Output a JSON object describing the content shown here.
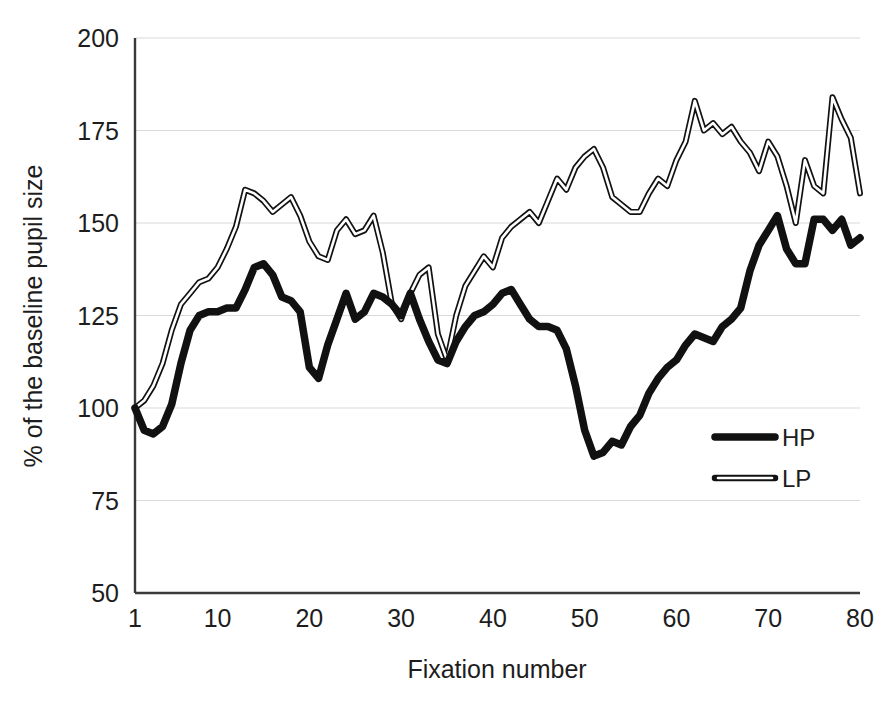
{
  "chart_data": {
    "type": "line",
    "title": "",
    "subtitle": "",
    "xlabel": "Fixation number",
    "ylabel": "% of the baseline pupil size",
    "xlim": [
      1,
      80
    ],
    "ylim": [
      50,
      200
    ],
    "xticks": [
      1,
      10,
      20,
      30,
      40,
      50,
      60,
      70,
      80
    ],
    "xtick_labels": [
      "1",
      "10",
      "20",
      "30",
      "40",
      "50",
      "60",
      "70",
      "80"
    ],
    "yticks": [
      50,
      75,
      100,
      125,
      150,
      175,
      200
    ],
    "ytick_labels": [
      "50",
      "75",
      "100",
      "125",
      "150",
      "175",
      "200"
    ],
    "grid": "horizontal-only",
    "grid_color": "#d9d9d9",
    "axis_color": "#3a3a3a",
    "legend_position": "inside-right-middle",
    "x": [
      1,
      2,
      3,
      4,
      5,
      6,
      7,
      8,
      9,
      10,
      11,
      12,
      13,
      14,
      15,
      16,
      17,
      18,
      19,
      20,
      21,
      22,
      23,
      24,
      25,
      26,
      27,
      28,
      29,
      30,
      31,
      32,
      33,
      34,
      35,
      36,
      37,
      38,
      39,
      40,
      41,
      42,
      43,
      44,
      45,
      46,
      47,
      48,
      49,
      50,
      51,
      52,
      53,
      54,
      55,
      56,
      57,
      58,
      59,
      60,
      61,
      62,
      63,
      64,
      65,
      66,
      67,
      68,
      69,
      70,
      71,
      72,
      73,
      74,
      75,
      76,
      77,
      78,
      79,
      80
    ],
    "series": [
      {
        "name": "HP",
        "color": "#111111",
        "line_width": 7,
        "style": "solid-thick",
        "values": [
          100,
          94,
          93,
          95,
          101,
          112,
          121,
          125,
          126,
          126,
          127,
          127,
          132,
          138,
          139,
          136,
          130,
          129,
          126,
          111,
          108,
          117,
          124,
          131,
          124,
          126,
          131,
          130,
          128,
          125,
          131,
          124,
          118,
          113,
          112,
          118,
          122,
          125,
          126,
          128,
          131,
          132,
          128,
          124,
          122,
          122,
          121,
          116,
          106,
          94,
          87,
          88,
          91,
          90,
          95,
          98,
          104,
          108,
          111,
          113,
          117,
          120,
          119,
          118,
          122,
          124,
          127,
          137,
          144,
          148,
          152,
          143,
          139,
          139,
          151,
          151,
          148,
          151,
          144,
          146
        ]
      },
      {
        "name": "LP",
        "color": "#111111",
        "line_width": 2,
        "style": "thin-outline",
        "values": [
          100,
          102,
          106,
          112,
          121,
          128,
          131,
          134,
          135,
          138,
          143,
          149,
          159,
          158,
          156,
          153,
          155,
          157,
          152,
          145,
          141,
          140,
          148,
          151,
          147,
          148,
          152,
          142,
          128,
          124,
          131,
          136,
          138,
          120,
          113,
          125,
          133,
          137,
          141,
          138,
          146,
          149,
          151,
          153,
          150,
          156,
          162,
          159,
          165,
          168,
          170,
          165,
          157,
          155,
          153,
          153,
          158,
          162,
          160,
          167,
          172,
          183,
          175,
          177,
          174,
          176,
          172,
          169,
          164,
          172,
          168,
          160,
          150,
          167,
          160,
          158,
          184,
          178,
          173,
          158
        ]
      }
    ],
    "legend": [
      {
        "label": "HP",
        "style": "solid-thick"
      },
      {
        "label": "LP",
        "style": "thin-outline"
      }
    ]
  },
  "geometry": {
    "plot_left": 135,
    "plot_right": 860,
    "plot_top": 38,
    "plot_bottom": 593
  }
}
